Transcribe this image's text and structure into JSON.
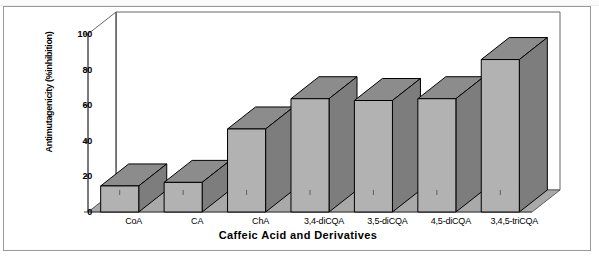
{
  "figure": {
    "frame_present": true,
    "plot_style": "3d-column",
    "colors": {
      "bar_front": "#b2b2b2",
      "bar_side": "#7d7d7d",
      "bar_top": "#8c8c8c",
      "floor": "#a9a9a9",
      "wall": "#ffffff",
      "outline": "#000000",
      "frame": "#9a9a9a",
      "axis": "#555555"
    }
  },
  "chart_data": {
    "type": "bar",
    "title": "",
    "subtitle": "",
    "xlabel": "Caffeic Acid and Derivatives",
    "ylabel": "Antimutagenicity (%inhibition)",
    "categories": [
      "CoA",
      "CA",
      "ChA",
      "3,4-diCQA",
      "3,5-diCQA",
      "4,5-diCQA",
      "3,4,5-triCQA"
    ],
    "values": [
      27,
      29,
      59,
      76,
      75,
      76,
      98
    ],
    "ylim": [
      0,
      100
    ],
    "yticks": [
      0,
      20,
      40,
      60,
      80,
      100
    ],
    "ytick_labels": [
      "0",
      "20",
      "40",
      "60",
      "80",
      "100"
    ],
    "grid": false,
    "legend": null,
    "legend_position": "none",
    "series": [
      {
        "name": "Antimutagenicity",
        "values": [
          27,
          29,
          59,
          76,
          75,
          76,
          98
        ]
      }
    ],
    "annotations": []
  }
}
